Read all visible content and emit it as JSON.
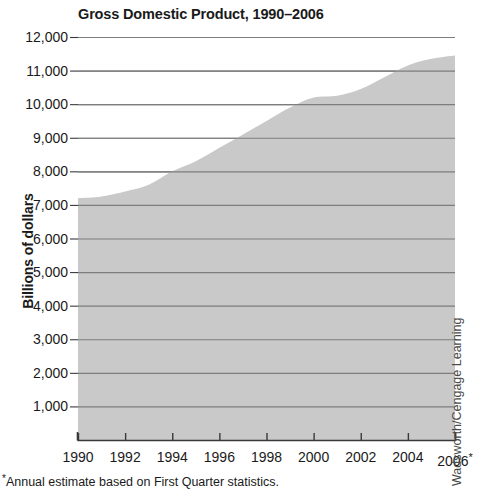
{
  "chart_data": {
    "type": "area",
    "title": "Gross Domestic Product, 1990–2006",
    "xlabel": "",
    "ylabel": "Billions of dollars",
    "x": [
      1990,
      1991,
      1992,
      1993,
      1994,
      1995,
      1996,
      1997,
      1998,
      1999,
      2000,
      2001,
      2002,
      2003,
      2004,
      2005,
      2006
    ],
    "values": [
      7200,
      7250,
      7400,
      7600,
      8000,
      8300,
      8700,
      9100,
      9500,
      9900,
      10200,
      10250,
      10450,
      10800,
      11150,
      11350,
      11450
    ],
    "series": [
      {
        "name": "Gross Domestic Product",
        "values": [
          7200,
          7250,
          7400,
          7600,
          8000,
          8300,
          8700,
          9100,
          9500,
          9900,
          10200,
          10250,
          10450,
          10800,
          11150,
          11350,
          11450
        ]
      }
    ],
    "x_tick_labels": [
      "1990",
      "1992",
      "1994",
      "1996",
      "1998",
      "2000",
      "2002",
      "2004",
      "2006"
    ],
    "x_tick_values": [
      1990,
      1992,
      1994,
      1996,
      1998,
      2000,
      2002,
      2004,
      2006
    ],
    "x_tick_suffix_last": "*",
    "y_tick_labels": [
      "12,000",
      "11,000",
      "10,000",
      "9,000",
      "8,000",
      "7,000",
      "6,000",
      "5,000",
      "4,000",
      "3,000",
      "2,000",
      "1,000"
    ],
    "y_tick_values": [
      12000,
      11000,
      10000,
      9000,
      8000,
      7000,
      6000,
      5000,
      4000,
      3000,
      2000,
      1000
    ],
    "xlim": [
      1990,
      2006
    ],
    "ylim": [
      0,
      12000
    ],
    "grid": "horizontal",
    "legend": "none",
    "area_fill_color": "#c9c9c9",
    "gridline_color": "#7d7d7d",
    "axis_color": "#3a3a3a",
    "text_color": "#1a1a1a"
  },
  "footnote": {
    "marker": "*",
    "text": "Annual estimate based on First Quarter statistics."
  },
  "credit": {
    "text": "Wadsworth/Cengage Learning"
  }
}
